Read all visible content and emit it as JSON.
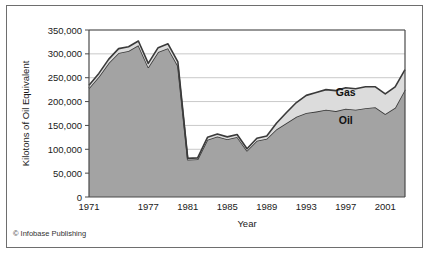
{
  "figure": {
    "credit": "© Infobase Publishing",
    "frame_color": "#6e6e6e",
    "background": "#ffffff"
  },
  "chart_data": {
    "type": "area",
    "stacked": true,
    "title": "",
    "xlabel": "Year",
    "ylabel": "Kilotons of Oil Equivalent",
    "xlim": [
      1971,
      2003
    ],
    "ylim": [
      0,
      350000
    ],
    "ytick_step": 50000,
    "yticks": [
      0,
      50000,
      100000,
      150000,
      200000,
      250000,
      300000,
      350000
    ],
    "ytick_labels": [
      "0",
      "50,000",
      "100,000",
      "150,000",
      "200,000",
      "250,000",
      "300,000",
      "350,000"
    ],
    "xticks": [
      1971,
      1977,
      1981,
      1985,
      1989,
      1993,
      1997,
      2001
    ],
    "xtick_labels": [
      "1971",
      "1977",
      "1981",
      "1985",
      "1989",
      "1993",
      "1997",
      "2001"
    ],
    "grid": "horizontal",
    "grid_color": "#c9c9c9",
    "legend_position": "inline-annotation",
    "x": [
      1971,
      1972,
      1973,
      1974,
      1975,
      1976,
      1977,
      1978,
      1979,
      1980,
      1981,
      1982,
      1983,
      1984,
      1985,
      1986,
      1987,
      1988,
      1989,
      1990,
      1991,
      1992,
      1993,
      1994,
      1995,
      1996,
      1997,
      1998,
      1999,
      2000,
      2001,
      2002,
      2003
    ],
    "series": [
      {
        "name": "Oil",
        "color": "#a3a3a3",
        "line_color": "#3a3a3a",
        "values": [
          228000,
          252000,
          281000,
          302000,
          306000,
          318000,
          272000,
          304000,
          312000,
          275000,
          78000,
          79000,
          120000,
          127000,
          121000,
          126000,
          97000,
          118000,
          122000,
          142000,
          155000,
          168000,
          176000,
          179000,
          183000,
          180000,
          185000,
          183000,
          186000,
          188000,
          174000,
          187000,
          225000
        ]
      },
      {
        "name": "Gas",
        "color": "#dcdcdc",
        "line_color": "#3a3a3a",
        "values": [
          6000,
          7000,
          8000,
          9000,
          9000,
          9000,
          8000,
          9000,
          9000,
          8000,
          3000,
          3000,
          5000,
          5000,
          5000,
          5000,
          4000,
          5000,
          6000,
          13000,
          22000,
          30000,
          37000,
          40000,
          42000,
          43000,
          44000,
          44000,
          45000,
          43000,
          42000,
          44000,
          42000
        ]
      }
    ],
    "annotations": [
      {
        "label": "Gas",
        "x": 1997,
        "y": 212000
      },
      {
        "label": "Oil",
        "x": 1997,
        "y": 152000
      }
    ]
  }
}
